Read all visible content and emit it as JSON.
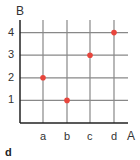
{
  "chart_data": {
    "type": "scatter",
    "title": "",
    "xlabel": "A",
    "ylabel": "B",
    "categories": [
      "a",
      "b",
      "c",
      "d"
    ],
    "y_ticks": [
      1,
      2,
      3,
      4
    ],
    "points": [
      {
        "x": "a",
        "y": 2
      },
      {
        "x": "b",
        "y": 1
      },
      {
        "x": "c",
        "y": 3
      },
      {
        "x": "d",
        "y": 4
      }
    ],
    "grid": true,
    "ylim": [
      0,
      4
    ]
  },
  "colors": {
    "point": "#e8453c",
    "grid": "#888888",
    "axis": "#222222"
  },
  "caption": "d"
}
